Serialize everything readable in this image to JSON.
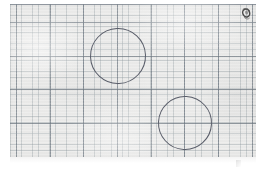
{
  "image": {
    "kind": "scanned-graph-paper",
    "width": 267,
    "height": 171,
    "background_color": "#ffffff",
    "alt_text": "Scanned sheet of graph paper with two hand-drawn circles"
  },
  "sheet": {
    "label": "graph-paper-sheet",
    "paper_color": "#ececeb",
    "left": 10,
    "top": 4,
    "width": 246,
    "height": 153,
    "grid": {
      "minor_spacing_px": 5.62,
      "minor_color": "#96a0a5",
      "major_spacing_px": 33.7,
      "major_color": "#6e7882",
      "grid_visible": true
    }
  },
  "annotations": {
    "circles": [
      {
        "name": "upper-left-circle",
        "center_x": 118,
        "center_y": 56,
        "radius": 28,
        "stroke_color": "#585c68",
        "stroke_width": 1.1
      },
      {
        "name": "lower-right-circle",
        "center_x": 185,
        "center_y": 123,
        "radius": 27,
        "stroke_color": "#585c68",
        "stroke_width": 1.1
      }
    ],
    "marks": [
      {
        "name": "corner-smudge",
        "x": 239,
        "y": 6,
        "width": 14,
        "height": 16,
        "color": "#3a3a3a"
      }
    ]
  },
  "chart_data": {
    "type": "scatter",
    "title": "",
    "subtitle": "",
    "xlabel": "",
    "ylabel": "",
    "grid": true,
    "legend": "none",
    "xlim": [
      10,
      256
    ],
    "ylim": [
      4,
      157
    ],
    "series": [
      {
        "name": "hand-drawn circles",
        "marker": "open-circle",
        "points": [
          {
            "x": 118,
            "y": 56,
            "r": 28
          },
          {
            "x": 185,
            "y": 123,
            "r": 27
          }
        ]
      }
    ],
    "annotations": [
      {
        "type": "smudge",
        "x": 246,
        "y": 14
      }
    ]
  }
}
